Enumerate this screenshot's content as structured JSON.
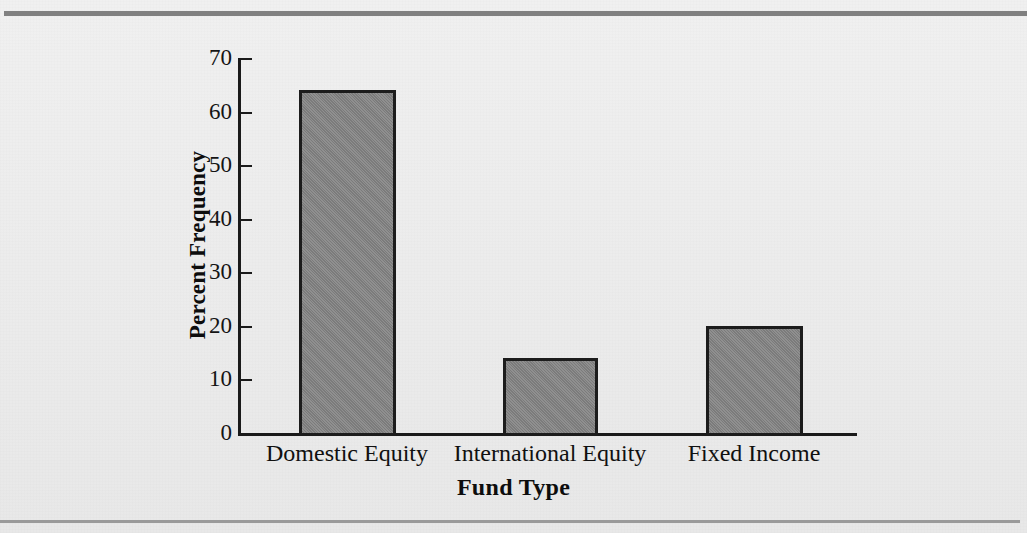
{
  "page": {
    "background_color": "#ececec",
    "rule_color": "#808080"
  },
  "chart_data": {
    "type": "bar",
    "title": "",
    "subtitle": "",
    "xlabel": "Fund Type",
    "ylabel": "Percent Frequency",
    "categories": [
      "Domestic Equity",
      "International Equity",
      "Fixed Income"
    ],
    "values": [
      64.0,
      14.0,
      20.0
    ],
    "series": [
      {
        "name": "Percent Frequency",
        "values": [
          64.0,
          14.0,
          20.0
        ]
      }
    ],
    "ylim": [
      0,
      70
    ],
    "ytick_labels": [
      "0",
      "10",
      "20",
      "30",
      "40",
      "50",
      "60",
      "70"
    ],
    "ytick_values": [
      0,
      10,
      20,
      30,
      40,
      50,
      60,
      70
    ],
    "grid": false,
    "legend": "none",
    "bar_fill_color": "#838383",
    "bar_edge_color": "#1c1c1c",
    "axis_color": "#1a1a1a",
    "annotations": []
  }
}
